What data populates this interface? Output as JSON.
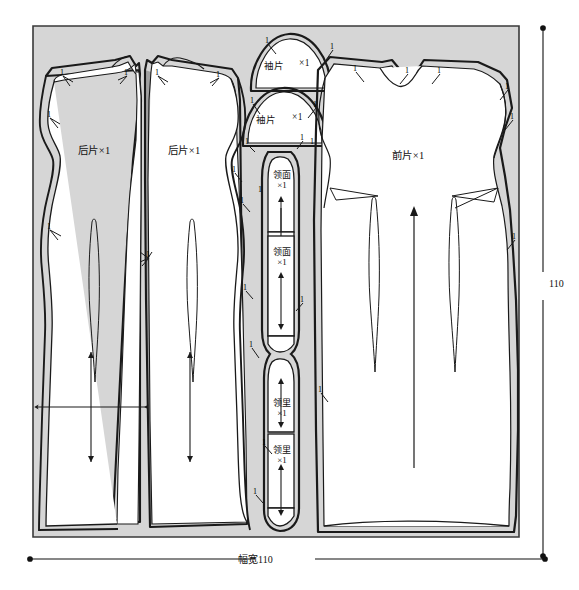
{
  "diagram": {
    "fabric": {
      "fill": "#d6d6d6",
      "stroke": "#2a2a2a",
      "x": 33,
      "y": 26,
      "w": 486,
      "h": 511
    },
    "piece_fill": "#ffffff",
    "piece_stroke": "#1a1a1a",
    "dimensions": {
      "bottom": {
        "label": "幅宽110",
        "value": "110",
        "name": "幅宽"
      },
      "right": {
        "label": "110",
        "value": "110"
      }
    },
    "pieces": [
      {
        "id": "back-panel-left",
        "label": "后片×1",
        "lines": [
          "后片×1"
        ],
        "lx": 78,
        "ly": 148
      },
      {
        "id": "back-panel-right",
        "label": "后片×1",
        "lines": [
          "后片×1"
        ],
        "lx": 168,
        "ly": 148
      },
      {
        "id": "sleeve-upper",
        "label": "袖片",
        "suffix": "×1",
        "lines": [
          "袖片",
          "×1"
        ],
        "lx": 264,
        "ly": 64
      },
      {
        "id": "sleeve-lower",
        "label": "袖片",
        "suffix": "×1",
        "lines": [
          "袖片",
          "×1"
        ],
        "lx": 258,
        "ly": 117
      },
      {
        "id": "collar-face-upper",
        "label": "领面×1",
        "lines": [
          "领面",
          "×1"
        ],
        "lx": 278,
        "ly": 178
      },
      {
        "id": "collar-face-lower",
        "label": "领面×1",
        "lines": [
          "领面",
          "×1"
        ],
        "lx": 278,
        "ly": 253
      },
      {
        "id": "collar-lining-upper",
        "label": "领里×1",
        "lines": [
          "领里",
          "×1"
        ],
        "lx": 280,
        "ly": 404
      },
      {
        "id": "collar-lining-lower",
        "label": "领里×1",
        "lines": [
          "领里",
          "×1"
        ],
        "lx": 280,
        "ly": 451
      },
      {
        "id": "front-panel",
        "label": "前片×1",
        "lines": [
          "前片×1"
        ],
        "lx": 392,
        "ly": 153
      }
    ],
    "seam_allowance_value": "1",
    "seam_allowance_marks": [
      {
        "x": 60,
        "y": 68
      },
      {
        "x": 124,
        "y": 68
      },
      {
        "x": 155,
        "y": 68
      },
      {
        "x": 216,
        "y": 70
      },
      {
        "x": 47,
        "y": 110
      },
      {
        "x": 47,
        "y": 222
      },
      {
        "x": 146,
        "y": 250
      },
      {
        "x": 232,
        "y": 165
      },
      {
        "x": 240,
        "y": 196
      },
      {
        "x": 243,
        "y": 283
      },
      {
        "x": 249,
        "y": 340
      },
      {
        "x": 253,
        "y": 487
      },
      {
        "x": 258,
        "y": 185
      },
      {
        "x": 265,
        "y": 36
      },
      {
        "x": 330,
        "y": 42
      },
      {
        "x": 250,
        "y": 96
      },
      {
        "x": 313,
        "y": 100
      },
      {
        "x": 245,
        "y": 137
      },
      {
        "x": 300,
        "y": 133
      },
      {
        "x": 310,
        "y": 137
      },
      {
        "x": 300,
        "y": 295
      },
      {
        "x": 262,
        "y": 438
      },
      {
        "x": 353,
        "y": 64
      },
      {
        "x": 405,
        "y": 66
      },
      {
        "x": 437,
        "y": 66
      },
      {
        "x": 505,
        "y": 82
      },
      {
        "x": 510,
        "y": 112
      },
      {
        "x": 512,
        "y": 232
      },
      {
        "x": 318,
        "y": 385
      }
    ]
  }
}
